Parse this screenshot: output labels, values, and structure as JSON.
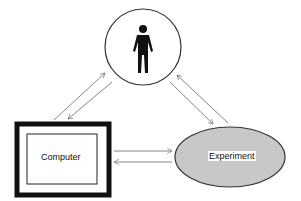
{
  "diagram": {
    "nodes": [
      {
        "id": "human",
        "label": "",
        "shape": "circle",
        "icon": "person-icon"
      },
      {
        "id": "computer",
        "label": "Computer",
        "shape": "framed-rectangle"
      },
      {
        "id": "experiment",
        "label": "Experiment",
        "shape": "ellipse",
        "fill": "#c8c8c8"
      }
    ],
    "edges": [
      {
        "from": "computer",
        "to": "human"
      },
      {
        "from": "human",
        "to": "computer"
      },
      {
        "from": "human",
        "to": "experiment"
      },
      {
        "from": "experiment",
        "to": "human"
      },
      {
        "from": "computer",
        "to": "experiment"
      },
      {
        "from": "experiment",
        "to": "computer"
      }
    ]
  },
  "labels": {
    "computer": "Computer",
    "experiment": "Experiment"
  },
  "colors": {
    "stroke": "#333333",
    "arrow": "#777777",
    "ellipse_fill": "#c8c8c8",
    "frame": "#111111"
  }
}
